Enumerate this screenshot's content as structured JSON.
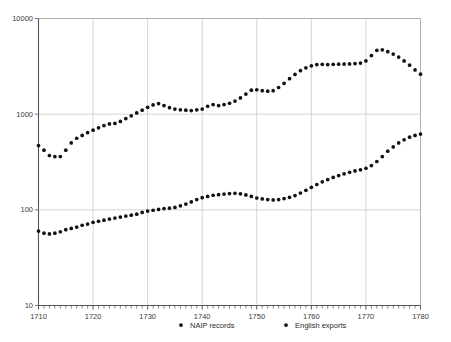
{
  "chart_data": {
    "type": "scatter",
    "title": "",
    "xlabel": "",
    "ylabel": "",
    "yscale": "log",
    "xlim": [
      1710,
      1780
    ],
    "ylim": [
      10,
      10000
    ],
    "grid": true,
    "legend_position": "bottom",
    "y_ticks": [
      "10000",
      "1000",
      "100",
      "10"
    ],
    "y_tick_values": [
      10000,
      1000,
      100,
      10
    ],
    "x_ticks": [
      "1710",
      "1720",
      "1730",
      "1740",
      "1750",
      "1760",
      "1770",
      "1780"
    ],
    "x_tick_values": [
      1710,
      1720,
      1730,
      1740,
      1750,
      1760,
      1770,
      1780
    ],
    "x_minor_tick_step": 1,
    "marker": "filled-circle",
    "marker_color": "#111111",
    "series": [
      {
        "name": "NAIP records",
        "x": [
          1710,
          1711,
          1712,
          1713,
          1714,
          1715,
          1716,
          1717,
          1718,
          1719,
          1720,
          1721,
          1722,
          1723,
          1724,
          1725,
          1726,
          1727,
          1728,
          1729,
          1730,
          1731,
          1732,
          1733,
          1734,
          1735,
          1736,
          1737,
          1738,
          1739,
          1740,
          1741,
          1742,
          1743,
          1744,
          1745,
          1746,
          1747,
          1748,
          1749,
          1750,
          1751,
          1752,
          1753,
          1754,
          1755,
          1756,
          1757,
          1758,
          1759,
          1760,
          1761,
          1762,
          1763,
          1764,
          1765,
          1766,
          1767,
          1768,
          1769,
          1770,
          1771,
          1772,
          1773,
          1774,
          1775,
          1776,
          1777,
          1778,
          1779,
          1780
        ],
        "values": [
          470,
          420,
          370,
          360,
          360,
          420,
          500,
          560,
          600,
          640,
          680,
          720,
          760,
          790,
          800,
          840,
          900,
          960,
          1030,
          1100,
          1180,
          1250,
          1290,
          1230,
          1170,
          1130,
          1110,
          1100,
          1090,
          1110,
          1130,
          1210,
          1260,
          1230,
          1260,
          1300,
          1370,
          1480,
          1620,
          1780,
          1800,
          1760,
          1740,
          1760,
          1900,
          2100,
          2350,
          2600,
          2850,
          3050,
          3200,
          3300,
          3320,
          3300,
          3320,
          3330,
          3340,
          3350,
          3380,
          3420,
          3600,
          4100,
          4650,
          4700,
          4500,
          4250,
          3950,
          3600,
          3250,
          2900,
          2620
        ]
      },
      {
        "name": "English exports",
        "x": [
          1710,
          1711,
          1712,
          1713,
          1714,
          1715,
          1716,
          1717,
          1718,
          1719,
          1720,
          1721,
          1722,
          1723,
          1724,
          1725,
          1726,
          1727,
          1728,
          1729,
          1730,
          1731,
          1732,
          1733,
          1734,
          1735,
          1736,
          1737,
          1738,
          1739,
          1740,
          1741,
          1742,
          1743,
          1744,
          1745,
          1746,
          1747,
          1748,
          1749,
          1750,
          1751,
          1752,
          1753,
          1754,
          1755,
          1756,
          1757,
          1758,
          1759,
          1760,
          1761,
          1762,
          1763,
          1764,
          1765,
          1766,
          1767,
          1768,
          1769,
          1770,
          1771,
          1772,
          1773,
          1774,
          1775,
          1776,
          1777,
          1778,
          1779,
          1780
        ],
        "values": [
          60,
          57,
          56,
          57,
          59,
          62,
          64,
          66,
          69,
          71,
          74,
          76,
          78,
          80,
          82,
          84,
          86,
          88,
          90,
          94,
          97,
          99,
          101,
          103,
          104,
          106,
          110,
          115,
          121,
          128,
          134,
          138,
          142,
          144,
          146,
          148,
          149,
          147,
          143,
          138,
          133,
          130,
          128,
          127,
          128,
          131,
          135,
          141,
          150,
          160,
          172,
          184,
          196,
          207,
          218,
          228,
          238,
          247,
          255,
          262,
          272,
          290,
          320,
          360,
          410,
          455,
          500,
          540,
          575,
          600,
          620
        ]
      }
    ]
  },
  "legend": {
    "items": [
      {
        "label": "NAIP records",
        "marker": "filled-circle",
        "color": "#111111"
      },
      {
        "label": "English exports",
        "marker": "filled-circle",
        "color": "#111111"
      }
    ]
  }
}
